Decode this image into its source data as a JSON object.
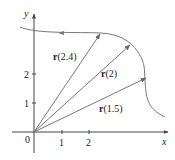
{
  "diagram": {
    "axes": {
      "x_label": "x",
      "y_label": "y",
      "origin_label": "0",
      "x_ticks": [
        "1",
        "2"
      ],
      "y_ticks": [
        "1",
        "2"
      ]
    },
    "vectors": [
      {
        "label_bold": "r",
        "label_arg": "(2.4)"
      },
      {
        "label_bold": "r",
        "label_arg": "(2)"
      },
      {
        "label_bold": "r",
        "label_arg": "(1.5)"
      }
    ],
    "colors": {
      "curve": "#777777",
      "vectors": "#777777",
      "axes": "#444444",
      "text": "#222222"
    }
  }
}
